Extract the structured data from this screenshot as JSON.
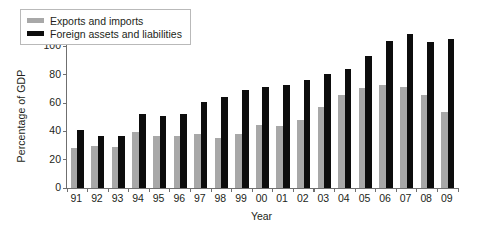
{
  "chart_data": {
    "type": "bar",
    "title": "",
    "xlabel": "Year",
    "ylabel": "Percentage of GDP",
    "ylim": [
      0,
      120
    ],
    "yticks": [
      0,
      20,
      40,
      60,
      80,
      100,
      120
    ],
    "grid": false,
    "legend_position": "top-left inside plot",
    "categories": [
      "91",
      "92",
      "93",
      "94",
      "95",
      "96",
      "97",
      "98",
      "99",
      "00",
      "01",
      "02",
      "03",
      "04",
      "05",
      "06",
      "07",
      "08",
      "09"
    ],
    "series": [
      {
        "name": "Exports and imports",
        "color": "#a8a8a8",
        "values": [
          28,
          30,
          29,
          39.5,
          37,
          36.5,
          38,
          35.5,
          38,
          44.5,
          43.5,
          48,
          57,
          66,
          70.5,
          73,
          71.5,
          65.5,
          53.5
        ]
      },
      {
        "name": "Foreign assets and liabilities",
        "color": "#0d0d0d",
        "values": [
          41,
          37,
          37,
          52,
          50.5,
          52.5,
          61,
          64,
          69.5,
          71,
          72.5,
          76,
          80.5,
          84,
          93.5,
          104,
          109,
          103,
          105
        ]
      }
    ]
  },
  "legend": {
    "items": [
      {
        "label": "Exports and imports",
        "swatch": "gray"
      },
      {
        "label": "Foreign assets and liabilities",
        "swatch": "black"
      }
    ]
  }
}
